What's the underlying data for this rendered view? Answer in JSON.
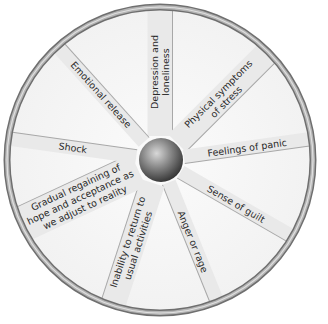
{
  "diagram": {
    "type": "wheel",
    "center_hub": "sphere",
    "spokes": [
      {
        "id": "depression",
        "lines": [
          "Depression and",
          "loneliness"
        ],
        "angle": -90
      },
      {
        "id": "physical",
        "lines": [
          "Physical symptoms",
          "of stress"
        ],
        "angle": -45
      },
      {
        "id": "panic",
        "lines": [
          "Feelings of panic"
        ],
        "angle": -8
      },
      {
        "id": "guilt",
        "lines": [
          "Sense of guilt"
        ],
        "angle": 30
      },
      {
        "id": "anger",
        "lines": [
          "Anger or rage"
        ],
        "angle": 68
      },
      {
        "id": "inability",
        "lines": [
          "Inability to return to",
          "usual activities"
        ],
        "angle": 108
      },
      {
        "id": "gradual",
        "lines": [
          "Gradual regaining of",
          "hope and acceptance as",
          "we adjust to reality"
        ],
        "angle": 155
      },
      {
        "id": "shock",
        "lines": [
          "Shock"
        ],
        "angle": 188
      },
      {
        "id": "emotional",
        "lines": [
          "Emotional release"
        ],
        "angle": 228
      }
    ]
  }
}
